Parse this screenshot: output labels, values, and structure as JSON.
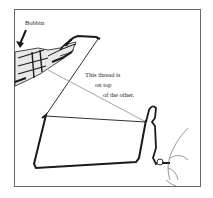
{
  "figure": {
    "labels": {
      "bobbin": "Bobbin",
      "note_line1": "This thread is",
      "note_line2": "on top",
      "note_line3": "of the other."
    },
    "colors": {
      "ink": "#1a1a1a",
      "light_thread": "#9a9a9a",
      "frame_border": "#6a6a6a",
      "background": "#ffffff"
    }
  }
}
